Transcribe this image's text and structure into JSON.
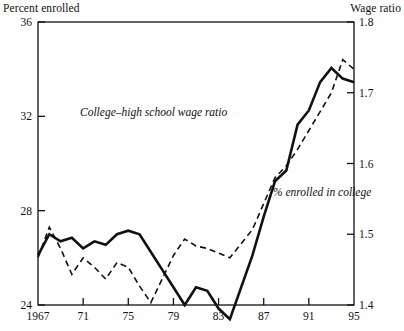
{
  "labels": {
    "left_axis_title": "Percent enrolled",
    "right_axis_title": "Wage ratio"
  },
  "annotations": {
    "wage_ratio": "College–high school wage ratio",
    "enrollment": "% enrolled in college"
  },
  "chart_data": {
    "type": "line",
    "title": "",
    "xlabel": "",
    "ylabel": "Percent enrolled",
    "y2label": "Wage ratio",
    "grid": false,
    "legend": "inline-annotations",
    "xlim": [
      1967,
      1995
    ],
    "ylim": [
      24,
      36
    ],
    "y2lim": [
      1.4,
      1.8
    ],
    "xticks": [
      1967,
      1971,
      1975,
      1979,
      1983,
      1987,
      1991,
      1995
    ],
    "xticklabels": [
      "1967",
      "71",
      "75",
      "79",
      "83",
      "87",
      "91",
      "95"
    ],
    "yticks": [
      24,
      28,
      32,
      36
    ],
    "yticklabels": [
      "24",
      "28",
      "32",
      "36"
    ],
    "y2ticks": [
      1.4,
      1.5,
      1.6,
      1.7,
      1.8
    ],
    "y2ticklabels": [
      "1.4",
      "1.5",
      "1.6",
      "1.7",
      "1.8"
    ],
    "x": [
      1967,
      1968,
      1969,
      1970,
      1971,
      1972,
      1973,
      1974,
      1975,
      1976,
      1977,
      1978,
      1979,
      1980,
      1981,
      1982,
      1983,
      1984,
      1985,
      1986,
      1987,
      1988,
      1989,
      1990,
      1991,
      1992,
      1993,
      1994,
      1995
    ],
    "series": [
      {
        "name": "College-high school wage ratio",
        "axis": "right",
        "style": "solid",
        "values": [
          1.47,
          1.5,
          1.49,
          1.495,
          1.48,
          1.49,
          1.485,
          1.5,
          1.505,
          1.5,
          1.475,
          1.45,
          1.425,
          1.4,
          1.425,
          1.42,
          1.395,
          1.38,
          1.425,
          1.47,
          1.525,
          1.575,
          1.59,
          1.655,
          1.675,
          1.715,
          1.735,
          1.72,
          1.715
        ]
      },
      {
        "name": "% enrolled in college",
        "axis": "left",
        "style": "dashed",
        "values": [
          26.0,
          27.3,
          26.4,
          25.3,
          26.0,
          25.6,
          25.1,
          25.8,
          25.6,
          24.8,
          24.1,
          25.1,
          26.1,
          26.8,
          26.5,
          26.4,
          26.2,
          26.0,
          26.6,
          27.2,
          28.3,
          29.4,
          29.9,
          30.6,
          31.4,
          32.2,
          33.0,
          34.4,
          34.0
        ]
      }
    ]
  }
}
